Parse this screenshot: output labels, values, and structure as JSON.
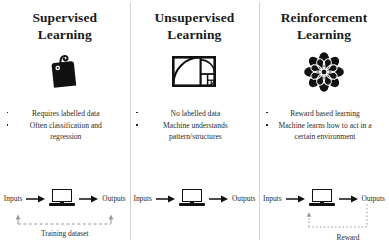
{
  "colors": {
    "ink": "#262626",
    "divider": "#d2d2d2",
    "icon": "#111111",
    "loop": "#9a9a9a"
  },
  "columns": [
    {
      "id": "supervised",
      "title_line1": "Supervised",
      "title_line2": "Learning",
      "icon": "price-tag-icon",
      "bullets": [
        "Requires labelled data",
        "Often classification and regression"
      ],
      "flow": {
        "input_label": "Inputs",
        "machine": "laptop-icon",
        "output_label": "Outputs",
        "loop_caption": "Training dataset",
        "loop_style": "dashed"
      }
    },
    {
      "id": "unsupervised",
      "title_line1": "Unsupervised",
      "title_line2": "Learning",
      "icon": "golden-ratio-spiral-icon",
      "bullets": [
        "No labelled data",
        "Machine understands pattern/structures"
      ],
      "flow": {
        "input_label": "Inputs",
        "machine": "laptop-icon",
        "output_label": "Outputs",
        "loop_caption": "",
        "loop_style": "none"
      }
    },
    {
      "id": "reinforcement",
      "title_line1": "Reinforcement",
      "title_line2": "Learning",
      "icon": "rosette-flower-icon",
      "bullets": [
        "Reward based learning",
        "Machine learns how to act in a certain environment"
      ],
      "flow": {
        "input_label": "Inputs",
        "machine": "laptop-icon",
        "output_label": "Outputs",
        "loop_caption": "Reward",
        "loop_style": "dotted"
      }
    }
  ]
}
